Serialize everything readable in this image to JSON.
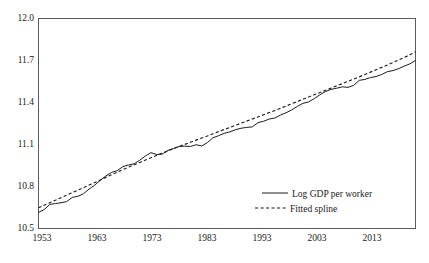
{
  "chart_data": {
    "type": "line",
    "title": "",
    "subtitle": "",
    "xlabel": "",
    "ylabel": "",
    "xlim": [
      1953,
      2020
    ],
    "ylim": [
      10.5,
      12.0
    ],
    "grid": false,
    "legend_position": "bottom-right",
    "xticks": [
      "1953",
      "1963",
      "1973",
      "1983",
      "1993",
      "2003",
      "2013"
    ],
    "xtick_values": [
      1953,
      1963,
      1973,
      1983,
      1993,
      2003,
      2013
    ],
    "yticks": [
      "10.5",
      "10.8",
      "11.1",
      "11.4",
      "11.7",
      "12.0"
    ],
    "ytick_values": [
      10.5,
      10.8,
      11.1,
      11.4,
      11.7,
      12.0
    ],
    "x": [
      1953,
      1954,
      1955,
      1956,
      1957,
      1958,
      1959,
      1960,
      1961,
      1962,
      1963,
      1964,
      1965,
      1966,
      1967,
      1968,
      1969,
      1970,
      1971,
      1972,
      1973,
      1974,
      1975,
      1976,
      1977,
      1978,
      1979,
      1980,
      1981,
      1982,
      1983,
      1984,
      1985,
      1986,
      1987,
      1988,
      1989,
      1990,
      1991,
      1992,
      1993,
      1994,
      1995,
      1996,
      1997,
      1998,
      1999,
      2000,
      2001,
      2002,
      2003,
      2004,
      2005,
      2006,
      2007,
      2008,
      2009,
      2010,
      2011,
      2012,
      2013,
      2014,
      2015,
      2016,
      2017,
      2018,
      2019,
      2020
    ],
    "series": [
      {
        "name": "Log GDP per worker",
        "style": "solid",
        "color": "#1c1c1c",
        "values": [
          10.615,
          10.635,
          10.672,
          10.678,
          10.684,
          10.692,
          10.722,
          10.73,
          10.748,
          10.782,
          10.81,
          10.845,
          10.876,
          10.901,
          10.913,
          10.942,
          10.954,
          10.962,
          10.988,
          11.018,
          11.042,
          11.028,
          11.032,
          11.058,
          11.071,
          11.086,
          11.088,
          11.086,
          11.098,
          11.09,
          11.113,
          11.148,
          11.163,
          11.18,
          11.19,
          11.206,
          11.216,
          11.222,
          11.226,
          11.256,
          11.266,
          11.282,
          11.289,
          11.31,
          11.327,
          11.347,
          11.372,
          11.394,
          11.404,
          11.428,
          11.455,
          11.478,
          11.494,
          11.502,
          11.512,
          11.508,
          11.522,
          11.558,
          11.565,
          11.578,
          11.586,
          11.6,
          11.62,
          11.628,
          11.642,
          11.66,
          11.676,
          11.7
        ]
      },
      {
        "name": "Fitted spline",
        "style": "dashed",
        "color": "#1c1c1c",
        "values": [
          10.648,
          10.666,
          10.684,
          10.702,
          10.72,
          10.738,
          10.756,
          10.774,
          10.792,
          10.81,
          10.828,
          10.847,
          10.866,
          10.885,
          10.903,
          10.921,
          10.938,
          10.955,
          10.972,
          10.989,
          11.006,
          11.022,
          11.038,
          11.054,
          11.07,
          11.086,
          11.101,
          11.116,
          11.131,
          11.146,
          11.161,
          11.177,
          11.192,
          11.207,
          11.222,
          11.237,
          11.252,
          11.267,
          11.282,
          11.297,
          11.312,
          11.328,
          11.343,
          11.359,
          11.375,
          11.391,
          11.407,
          11.423,
          11.439,
          11.455,
          11.471,
          11.487,
          11.503,
          11.519,
          11.535,
          11.551,
          11.567,
          11.583,
          11.6,
          11.617,
          11.634,
          11.651,
          11.668,
          11.686,
          11.704,
          11.722,
          11.741,
          11.762
        ]
      }
    ],
    "legend": [
      {
        "label": "Log GDP per worker",
        "style": "solid"
      },
      {
        "label": "Fitted spline",
        "style": "dashed"
      }
    ]
  },
  "legend": {
    "entry_0_label": "Log GDP per worker",
    "entry_1_label": "Fitted spline"
  },
  "axes": {
    "x_tick_0": "1953",
    "x_tick_1": "1963",
    "x_tick_2": "1973",
    "x_tick_3": "1983",
    "x_tick_4": "1993",
    "x_tick_5": "2003",
    "x_tick_6": "2013",
    "y_tick_0": "10.5",
    "y_tick_1": "10.8",
    "y_tick_2": "11.1",
    "y_tick_3": "11.4",
    "y_tick_4": "11.7",
    "y_tick_5": "12.0"
  }
}
